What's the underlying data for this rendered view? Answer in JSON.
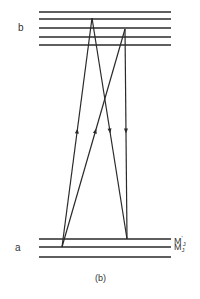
{
  "figure": {
    "caption": "(b)",
    "upper_state": {
      "label": "b",
      "levels_y": [
        12,
        19,
        28,
        37,
        45
      ]
    },
    "lower_state": {
      "label": "a",
      "levels_y": [
        239,
        247,
        257
      ],
      "level_labels": [
        {
          "main": "M",
          "sup": "'",
          "sub": "J"
        },
        {
          "main": "M",
          "sup": "",
          "sub": "J"
        }
      ]
    },
    "level_x_range": [
      39,
      171
    ],
    "transitions": [
      {
        "from": [
          62,
          247
        ],
        "to": [
          92,
          18
        ],
        "direction": "up"
      },
      {
        "from": [
          62,
          247
        ],
        "to": [
          125,
          29
        ],
        "direction": "up"
      },
      {
        "from": [
          92,
          18
        ],
        "to": [
          127,
          239
        ],
        "direction": "down"
      },
      {
        "from": [
          125,
          29
        ],
        "to": [
          127,
          239
        ],
        "direction": "down"
      }
    ],
    "line_color": "#2a2a2a"
  }
}
